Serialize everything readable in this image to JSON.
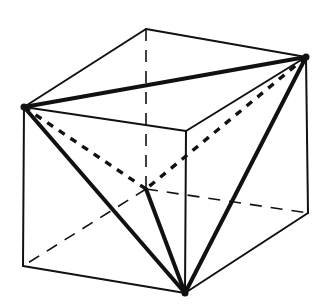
{
  "figure": {
    "vertices": {
      "A": [
        146,
        29
      ],
      "B": [
        24,
        107
      ],
      "C": [
        306,
        57
      ],
      "D": [
        186,
        131
      ],
      "E": [
        146,
        189
      ],
      "F": [
        23,
        266
      ],
      "G": [
        308,
        213
      ],
      "H": [
        185,
        293
      ]
    },
    "cube_visible_edges": [
      [
        "A",
        "B"
      ],
      [
        "A",
        "C"
      ],
      [
        "B",
        "D"
      ],
      [
        "C",
        "D"
      ],
      [
        "B",
        "F"
      ],
      [
        "D",
        "H"
      ],
      [
        "C",
        "G"
      ],
      [
        "F",
        "H"
      ],
      [
        "H",
        "G"
      ]
    ],
    "cube_hidden_edges": [
      [
        "A",
        "E"
      ],
      [
        "E",
        "F"
      ],
      [
        "E",
        "G"
      ]
    ],
    "tetrahedron_visible_edges": [
      [
        "B",
        "C"
      ],
      [
        "B",
        "H"
      ],
      [
        "C",
        "H"
      ],
      [
        "E",
        "H"
      ]
    ],
    "tetrahedron_hidden_edges": [
      [
        "B",
        "E"
      ],
      [
        "C",
        "E"
      ]
    ],
    "tetrahedron_vertices": [
      "B",
      "C",
      "H",
      "E"
    ],
    "colors": {
      "line": "#111111",
      "background": "#ffffff"
    }
  }
}
